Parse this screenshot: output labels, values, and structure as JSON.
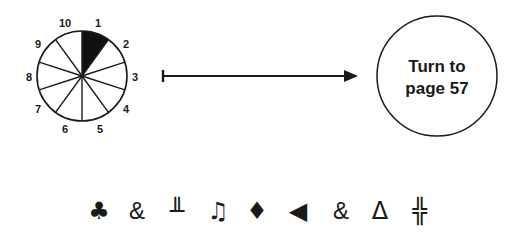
{
  "dial": {
    "segments": 10,
    "labels": [
      "1",
      "2",
      "3",
      "4",
      "5",
      "6",
      "7",
      "8",
      "9",
      "10"
    ],
    "highlighted_segment": 1,
    "highlight_color": "#000000"
  },
  "arrow": {
    "direction": "right"
  },
  "destination": {
    "line1": "Turn to",
    "line2": "page 57"
  },
  "symbols": [
    {
      "name": "club-suit",
      "glyph": "♣"
    },
    {
      "name": "ampersand",
      "glyph": "&"
    },
    {
      "name": "double-up-tack",
      "glyph": "╨"
    },
    {
      "name": "beamed-eighth-notes",
      "glyph": "♫"
    },
    {
      "name": "diamond-suit",
      "glyph": "♦"
    },
    {
      "name": "left-pointing-triangle",
      "glyph": "◀"
    },
    {
      "name": "ampersand",
      "glyph": "&"
    },
    {
      "name": "delta",
      "glyph": "Δ"
    },
    {
      "name": "double-cross",
      "glyph": "╬"
    }
  ]
}
